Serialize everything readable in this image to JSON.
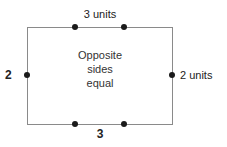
{
  "figure": {
    "type": "geometry-diagram",
    "shape": "rectangle",
    "background_color": "#ffffff",
    "stroke_color": "#8a8a8a",
    "marker_color": "#1a1a1a",
    "caption": {
      "line1": "Opposite",
      "line2": "sides",
      "line3": "equal"
    },
    "labels": {
      "top": "3 units",
      "bottom": "3",
      "left": "2",
      "right": "2 units"
    },
    "markers": {
      "top": [
        {
          "name": "top-division-point-1"
        },
        {
          "name": "top-division-point-2"
        }
      ],
      "bottom": [
        {
          "name": "bottom-division-point-1"
        },
        {
          "name": "bottom-division-point-2"
        }
      ],
      "left": [
        {
          "name": "left-midpoint"
        }
      ],
      "right": [
        {
          "name": "right-midpoint"
        }
      ]
    }
  }
}
